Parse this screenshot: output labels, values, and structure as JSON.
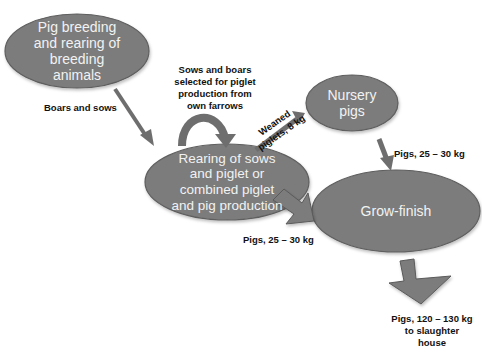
{
  "diagram": {
    "colors": {
      "node_fill": "#7b7b7b",
      "node_stroke": "#5e5e5e",
      "node_text": "#f2f2f2",
      "arrow_fill": "#7b7b7b",
      "arrow_stroke": "#5a5a5a",
      "label_text": "#111111",
      "background": "#ffffff"
    },
    "nodes": [
      {
        "id": "breeding",
        "lines": [
          "Pig breeding",
          "and rearing of",
          "breeding",
          "animals"
        ]
      },
      {
        "id": "rearing",
        "lines": [
          "Rearing of sows",
          "and piglet or",
          "combined piglet",
          "and pig production"
        ]
      },
      {
        "id": "nursery",
        "lines": [
          "Nursery",
          "pigs"
        ]
      },
      {
        "id": "grow_finish",
        "lines": [
          "Grow-finish"
        ]
      }
    ],
    "edges": [
      {
        "from": "breeding",
        "to": "rearing",
        "lines": [
          "Boars and sows"
        ]
      },
      {
        "from": "rearing",
        "to": "rearing",
        "lines": [
          "Sows and boars",
          "selected for piglet",
          "production from",
          "own farrows"
        ]
      },
      {
        "from": "rearing",
        "to": "nursery",
        "lines": [
          "Weaned",
          "piglets, 8 kg"
        ]
      },
      {
        "from": "nursery",
        "to": "grow_finish",
        "lines": [
          "Pigs, 25 – 30 kg"
        ]
      },
      {
        "from": "rearing",
        "to": "grow_finish",
        "lines": [
          "Pigs, 25 – 30 kg"
        ]
      },
      {
        "from": "grow_finish",
        "to": "slaughter",
        "lines": [
          "Pigs, 120 – 130 kg",
          "to slaughter",
          "house"
        ]
      }
    ]
  }
}
